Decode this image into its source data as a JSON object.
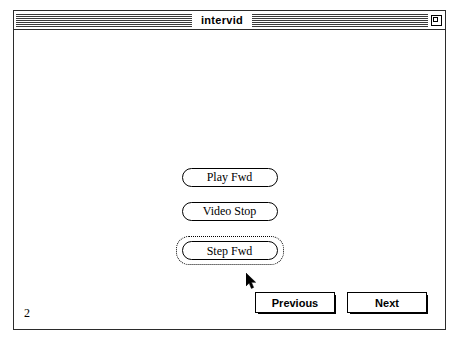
{
  "window": {
    "title": "intervid",
    "zoom_box_icon": "zoom-box-icon"
  },
  "content": {
    "video_controls": [
      {
        "label": "Play Fwd",
        "name": "play-fwd-button",
        "focused": false
      },
      {
        "label": "Video Stop",
        "name": "video-stop-button",
        "focused": false
      },
      {
        "label": "Step Fwd",
        "name": "step-fwd-button",
        "focused": true
      }
    ],
    "navigation": {
      "previous_label": "Previous",
      "next_label": "Next"
    },
    "page_number": "2"
  },
  "cursor": {
    "type": "arrow-pointer",
    "x": 232,
    "y": 243
  },
  "colors": {
    "frame": "#2b2b2b",
    "text": "#000000",
    "background": "#ffffff",
    "title_stripe": "#3a3a3a"
  }
}
